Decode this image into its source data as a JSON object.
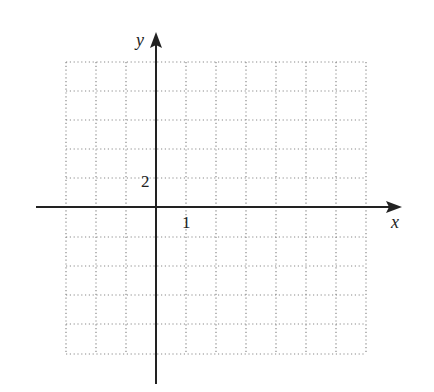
{
  "axes": {
    "x_label": "x",
    "y_label": "y",
    "x_tick_label": "1",
    "y_tick_label": "2",
    "color": "#222222"
  },
  "grid": {
    "columns": 10,
    "rows": 10,
    "style": "dotted",
    "color": "#888888",
    "x_units_per_cell": 1,
    "y_units_per_cell": 2,
    "x_range": [
      -3,
      7
    ],
    "y_range": [
      -10,
      10
    ]
  }
}
